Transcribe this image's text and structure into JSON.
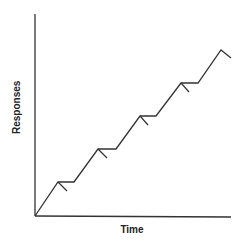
{
  "chart_data": {
    "type": "line",
    "title": "",
    "xlabel": "Time",
    "ylabel": "Responses",
    "grid": false,
    "legend": null,
    "series": [
      {
        "name": "cumulative responses",
        "points_px": [
          [
            35,
            216
          ],
          [
            58,
            182
          ],
          [
            74,
            182
          ],
          [
            98,
            149
          ],
          [
            116,
            149
          ],
          [
            140,
            116
          ],
          [
            156,
            116
          ],
          [
            181,
            83
          ],
          [
            198,
            83
          ],
          [
            221,
            50
          ],
          [
            231,
            58
          ]
        ]
      }
    ],
    "reinforcement_marks_px": [
      [
        [
          58,
          182
        ],
        [
          67,
          191
        ]
      ],
      [
        [
          98,
          149
        ],
        [
          107,
          158
        ]
      ],
      [
        [
          140,
          116
        ],
        [
          148,
          125
        ]
      ],
      [
        [
          181,
          83
        ],
        [
          189,
          92
        ]
      ]
    ],
    "color": "#333333"
  }
}
